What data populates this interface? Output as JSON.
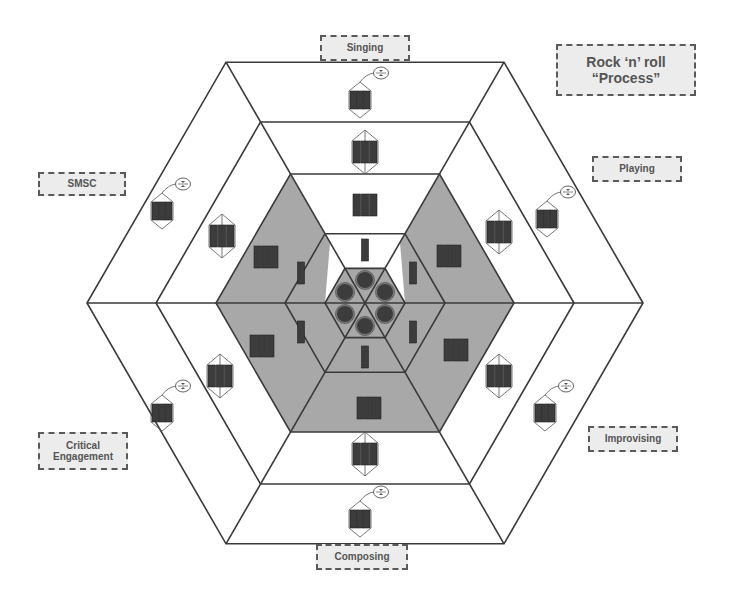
{
  "diagram": {
    "title_line1": "Rock ‘n’ roll",
    "title_line2": "“Process”",
    "sectors": [
      {
        "id": "singing",
        "label": "Singing"
      },
      {
        "id": "playing",
        "label": "Playing"
      },
      {
        "id": "improvising",
        "label": "Improvising"
      },
      {
        "id": "composing",
        "label": "Composing"
      },
      {
        "id": "critical-engagement",
        "label": "Critical Engagement",
        "label_line1": "Critical",
        "label_line2": "Engagement"
      },
      {
        "id": "smsc",
        "label": "SMSC"
      }
    ],
    "rings": 5,
    "center": [
      365,
      303
    ],
    "ring_radii": [
      278,
      209,
      149,
      80,
      40
    ],
    "icons": {
      "center_ring": "circle-token-icon",
      "ring_2": "single-bar-icon",
      "ring_3": "triple-bar-icon",
      "ring_4": "linked-triple-bar-icon",
      "ring_5": "triple-bar-with-loop-icon"
    },
    "colors": {
      "line": "#3a3a3a",
      "shaded_region": "#a8a8a8",
      "icon_fill": "#3c3c3c",
      "label_bg": "#ececec",
      "label_border": "#5a5a5a",
      "label_text": "#555555"
    }
  }
}
